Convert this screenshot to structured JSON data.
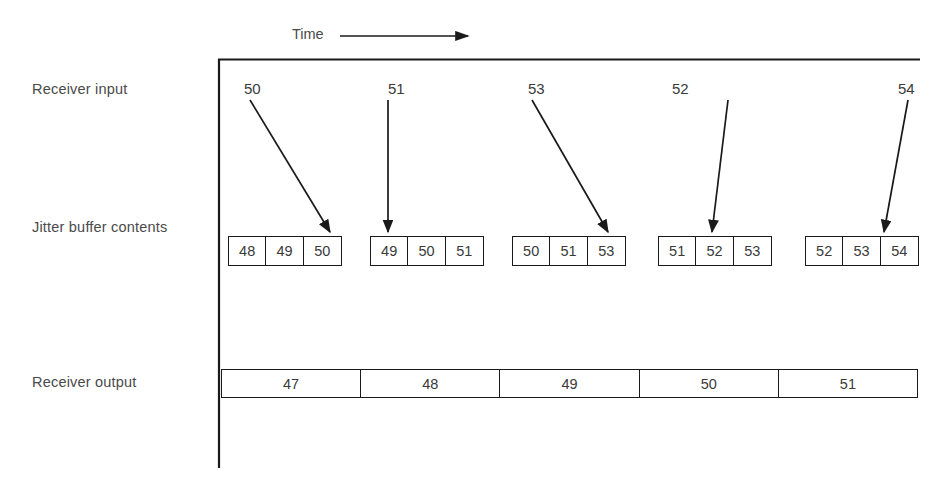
{
  "diagram": {
    "title_axis": "Time",
    "axis_arrow_icon": "right-arrow-icon",
    "rows": {
      "receiver_input_label": "Receiver input",
      "jitter_buffer_label": "Jitter buffer contents",
      "receiver_output_label": "Receiver output"
    },
    "receiver_input": [
      {
        "value": "50",
        "x": 244,
        "arrow": "diagonal-right-down"
      },
      {
        "value": "51",
        "x": 388,
        "arrow": "vertical-down"
      },
      {
        "value": "53",
        "x": 528,
        "arrow": "diagonal-right-down"
      },
      {
        "value": "52",
        "x": 672,
        "arrow": "diagonal-left-down"
      },
      {
        "value": "54",
        "x": 898,
        "arrow": "diagonal-left-down"
      }
    ],
    "jitter_buffer_groups": [
      {
        "x": 228,
        "cells": [
          "48",
          "49",
          "50"
        ]
      },
      {
        "x": 370,
        "cells": [
          "49",
          "50",
          "51"
        ]
      },
      {
        "x": 512,
        "cells": [
          "50",
          "51",
          "53"
        ]
      },
      {
        "x": 658,
        "cells": [
          "51",
          "52",
          "53"
        ]
      },
      {
        "x": 805,
        "cells": [
          "52",
          "53",
          "54"
        ]
      }
    ],
    "receiver_output": [
      "47",
      "48",
      "49",
      "50",
      "51"
    ],
    "colors": {
      "stroke": "#1a1a1a",
      "text": "#3a3a3a",
      "label": "#4a4a4a",
      "background": "#ffffff"
    }
  }
}
